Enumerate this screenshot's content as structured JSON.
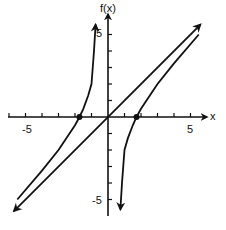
{
  "chart_data": {
    "type": "line",
    "title": "",
    "xlabel": "x",
    "ylabel": "f(x)",
    "xlim": [
      -6,
      6
    ],
    "ylim": [
      -6,
      6
    ],
    "x_tick_labels": [
      "-5",
      "5"
    ],
    "y_tick_labels": [
      "5",
      "-5"
    ],
    "grid": false,
    "series": [
      {
        "name": "asymptote y = x",
        "points": [
          [
            -5.7,
            -5.7
          ],
          [
            5.6,
            5.6
          ]
        ]
      },
      {
        "name": "f(x) left branch",
        "points": [
          [
            -5.5,
            -5.0
          ],
          [
            -4,
            -3.25
          ],
          [
            -3,
            -2.0
          ],
          [
            -2,
            -0.5
          ],
          [
            -1.73,
            0
          ],
          [
            -1.5,
            0.5
          ],
          [
            -1.2,
            1.3
          ],
          [
            -1.0,
            2.0
          ],
          [
            -0.85,
            4.0
          ],
          [
            -0.75,
            5.6
          ]
        ]
      },
      {
        "name": "f(x) right branch",
        "points": [
          [
            0.75,
            -5.6
          ],
          [
            0.85,
            -4.0
          ],
          [
            1.0,
            -2.0
          ],
          [
            1.2,
            -1.3
          ],
          [
            1.5,
            -0.5
          ],
          [
            1.73,
            0
          ],
          [
            2,
            0.5
          ],
          [
            3,
            2.0
          ],
          [
            4,
            3.25
          ],
          [
            5.5,
            5.0
          ]
        ]
      }
    ],
    "marked_points": [
      [
        -1.73,
        0
      ],
      [
        1.73,
        0
      ]
    ]
  },
  "labels": {
    "y_axis": "f(x)",
    "x_axis": "x",
    "x_neg5": "-5",
    "x_pos5": "5",
    "y_pos5": "5",
    "y_neg5": "-5"
  }
}
